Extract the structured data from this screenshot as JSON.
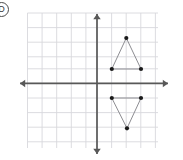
{
  "figure": {
    "option_label": "D",
    "background_color": "#ffffff"
  },
  "grid": {
    "color": "#d8d8dc",
    "line_width": 0.9,
    "left": 27.5,
    "top": 13,
    "right": 158,
    "bottom": 148,
    "spacing": 14.6,
    "visible": true,
    "x_lines": [
      27.5,
      42.1,
      56.7,
      71.3,
      85.9,
      97.0,
      111.6,
      126.2,
      140.8,
      155.4
    ],
    "y_lines": [
      13.0,
      27.6,
      42.2,
      56.8,
      68.8,
      83.4,
      98.0,
      112.6,
      127.2,
      141.8
    ]
  },
  "axes": {
    "color": "#585858",
    "line_width": 1.7,
    "arrow_size": 5.2,
    "origin": {
      "x": 97,
      "y": 83.4
    },
    "x_axis": {
      "name": "x-axis",
      "x1": 20,
      "y1": 83.4,
      "x2": 168,
      "y2": 83.4,
      "arrows": "both"
    },
    "y_axis": {
      "name": "y-axis",
      "x1": 97,
      "y1": 14,
      "x2": 97,
      "y2": 154,
      "arrows": "both"
    },
    "tick_labels": [],
    "axis_labels": []
  },
  "shapes": {
    "stroke_color": "#8d8d92",
    "stroke_width": 1.0,
    "vertex_color": "#1a1a1a",
    "vertex_radius": 2.1,
    "items": [
      {
        "name": "upper-triangle",
        "orientation": "points-up",
        "quadrant": "I",
        "points_px": [
          [
            126.3,
            38.0
          ],
          [
            111.8,
            69.0
          ],
          [
            141.0,
            69.0
          ]
        ],
        "points_grid": [
          [
            2,
            3.1
          ],
          [
            1,
            1
          ],
          [
            3,
            1
          ]
        ]
      },
      {
        "name": "lower-triangle",
        "orientation": "points-down",
        "quadrant": "IV",
        "points_px": [
          [
            111.8,
            98.0
          ],
          [
            141.0,
            98.0
          ],
          [
            127.0,
            128.3
          ]
        ],
        "points_grid": [
          [
            1,
            -1
          ],
          [
            3,
            -1
          ],
          [
            2,
            -3.1
          ]
        ]
      }
    ]
  }
}
